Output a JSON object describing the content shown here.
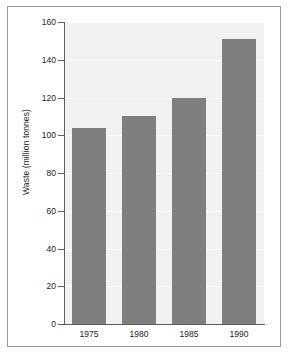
{
  "chart_data": {
    "type": "bar",
    "title": "",
    "subtitle": "",
    "xlabel": "",
    "ylabel": "Waste (million tonnes)",
    "categories": [
      "1975",
      "1980",
      "1985",
      "1990"
    ],
    "values": [
      104,
      110,
      120,
      151
    ],
    "series": [
      {
        "name": "Waste",
        "values": [
          104,
          110,
          120,
          151
        ]
      }
    ],
    "ylim": [
      0,
      160
    ],
    "ytick_labels": [
      "0",
      "20",
      "40",
      "60",
      "80",
      "100",
      "120",
      "140",
      "160"
    ],
    "ytick_values": [
      0,
      20,
      40,
      60,
      80,
      100,
      120,
      140,
      160
    ],
    "grid": true,
    "legend": "none",
    "bar_color": "#7f7f7f",
    "plot_background": "#f1f1f1",
    "gridline_color": "#ffffff",
    "axis_color": "#5e5e5e",
    "frame_color": "#9a9a9a",
    "page_background": "#ffffff"
  }
}
